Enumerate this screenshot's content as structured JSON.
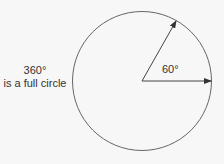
{
  "diagram": {
    "full_circle_value": "360°",
    "full_circle_caption": "is a full circle",
    "angle_label": "60°",
    "angle_degrees": 60,
    "line_color": "#555555"
  }
}
